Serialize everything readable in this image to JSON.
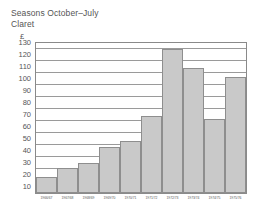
{
  "titles": {
    "line1": "Seasons October–July",
    "line2": "Claret",
    "currency": "£"
  },
  "chart_data": {
    "type": "bar",
    "title": "Seasons October–July",
    "subtitle": "Claret",
    "xlabel": "",
    "ylabel": "£",
    "ylim": [
      10,
      135
    ],
    "grid": true,
    "legend": "none",
    "yticks": [
      130,
      120,
      110,
      100,
      90,
      80,
      70,
      60,
      50,
      40,
      30,
      20,
      10
    ],
    "categories": [
      "1966/67",
      "1967/68",
      "1968/69",
      "1969/70",
      "1970/71",
      "1971/72",
      "1972/73",
      "1973/74",
      "1974/75",
      "1975/76"
    ],
    "values": [
      23,
      31,
      35,
      48,
      53,
      74,
      130,
      114,
      72,
      107
    ],
    "bar_color": "#c9c9c9",
    "bar_border_color": "#8e8e8e",
    "grid_color": "#9a9a9a",
    "axis_color": "#8a8a8a"
  }
}
